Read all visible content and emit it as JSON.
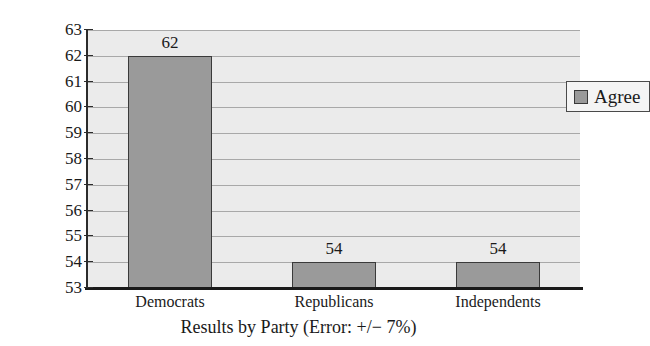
{
  "chart_data": {
    "type": "bar",
    "title": "",
    "categories": [
      "Democrats",
      "Republicans",
      "Independents"
    ],
    "values": [
      62,
      54,
      54
    ],
    "series": [
      {
        "name": "Agree",
        "values": [
          62,
          54,
          54
        ]
      }
    ],
    "data_labels": [
      "62",
      "54",
      "54"
    ],
    "xlabel": "Results by Party (Error: +/− 7%)",
    "ylabel": "Percent",
    "ylim": [
      53,
      63
    ],
    "ytick_values": [
      63,
      62,
      61,
      60,
      59,
      58,
      57,
      56,
      55,
      54,
      53
    ],
    "ytick_labels": [
      "63",
      "62",
      "61",
      "60",
      "59",
      "58",
      "57",
      "56",
      "55",
      "54",
      "53"
    ],
    "grid": true,
    "legend": {
      "position": "upper-right-inside",
      "entries": [
        {
          "label": "Agree",
          "color": "#9a9a9a"
        }
      ]
    },
    "colors": {
      "bar_fill": "#9a9a9a",
      "bar_edge": "#3a3a3a",
      "plot_background": "#ebebeb",
      "gridline": "#a8a8a8",
      "axis": "#1a1a1a",
      "text": "#1a1a1a"
    }
  }
}
